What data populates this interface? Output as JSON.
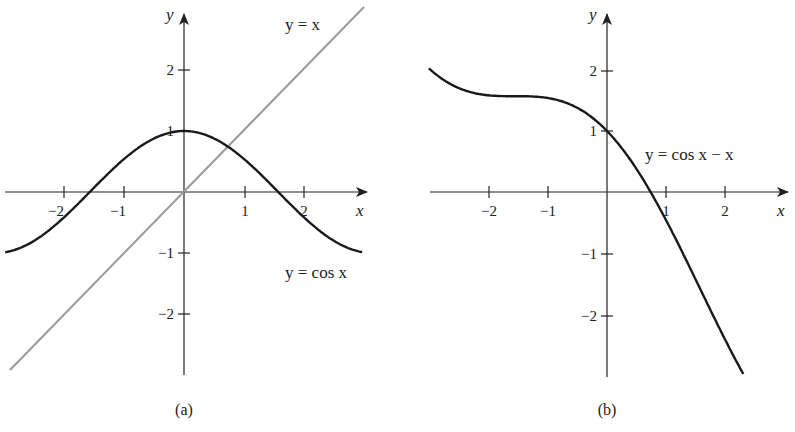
{
  "chart_data": [
    {
      "type": "line",
      "panel_label": "(a)",
      "xlabel": "x",
      "ylabel": "y",
      "xlim": [
        -3,
        3
      ],
      "ylim": [
        -3,
        3
      ],
      "x_ticks": [
        -2,
        -1,
        1,
        2
      ],
      "y_ticks": [
        -2,
        -1,
        1,
        2
      ],
      "x_tick_labels": [
        "−2",
        "−1",
        "1",
        "2"
      ],
      "y_tick_labels": [
        "−2",
        "−1",
        "1",
        "2"
      ],
      "grid": false,
      "series": [
        {
          "name": "y = cos x",
          "function": "cos(x)",
          "color": "#1a1a1a",
          "x": [
            -3,
            -2,
            -1.5708,
            -1,
            0,
            0.739,
            1,
            1.5708,
            2,
            3
          ],
          "y": [
            -0.99,
            -0.416,
            0,
            0.54,
            1,
            0.739,
            0.54,
            0,
            -0.416,
            -0.99
          ]
        },
        {
          "name": "y = x",
          "function": "x",
          "color": "#999999",
          "x": [
            -2.9,
            0,
            3.0
          ],
          "y": [
            -2.9,
            0,
            3.0
          ]
        }
      ],
      "annotations": [
        "y = x",
        "y = cos x"
      ],
      "intersection": {
        "x": 0.739,
        "y": 0.739
      }
    },
    {
      "type": "line",
      "panel_label": "(b)",
      "xlabel": "x",
      "ylabel": "y",
      "xlim": [
        -3,
        3
      ],
      "ylim": [
        -3,
        3
      ],
      "x_ticks": [
        -2,
        -1,
        1,
        2
      ],
      "y_ticks": [
        -2,
        -1,
        1,
        2
      ],
      "x_tick_labels": [
        "−2",
        "−1",
        "1",
        "2"
      ],
      "y_tick_labels": [
        "−2",
        "−1",
        "1",
        "2"
      ],
      "grid": false,
      "series": [
        {
          "name": "y = cos x − x",
          "function": "cos(x) - x",
          "color": "#1a1a1a",
          "x": [
            -3,
            -2,
            -1.5708,
            -1,
            0,
            0.739,
            1,
            2,
            2.3
          ],
          "y": [
            2.01,
            1.584,
            1.571,
            1.54,
            1,
            0,
            -0.46,
            -2.416,
            -2.966
          ]
        }
      ],
      "annotations": [
        "y = cos x − x"
      ],
      "root": {
        "x": 0.739,
        "y": 0
      }
    }
  ],
  "panel_a": {
    "caption": "(a)",
    "axis_x": "x",
    "axis_y": "y",
    "ticks": {
      "xm2": "−2",
      "xm1": "−1",
      "x1": "1",
      "x2": "2",
      "ym2": "−2",
      "ym1": "−1",
      "y1": "1",
      "y2": "2"
    },
    "label_line": "y = x",
    "label_cos": "y = cos x"
  },
  "panel_b": {
    "caption": "(b)",
    "axis_x": "x",
    "axis_y": "y",
    "ticks": {
      "xm2": "−2",
      "xm1": "−1",
      "x1": "1",
      "x2": "2",
      "ym2": "−2",
      "ym1": "−1",
      "y1": "1",
      "y2": "2"
    },
    "label_curve": "y = cos x − x"
  },
  "colors": {
    "curve": "#1a1a1a",
    "line": "#9a9a9a",
    "axis": "#222222"
  }
}
